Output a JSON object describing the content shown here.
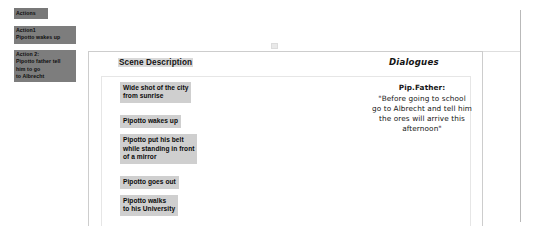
{
  "actions_panel": {
    "title": "Actions",
    "items": [
      {
        "name": "action-1",
        "lines": [
          "Action1",
          "Pipotto wakes up"
        ]
      },
      {
        "name": "action-2",
        "lines": [
          "Action 2:",
          "Pipotto father tell",
          "him to go",
          "to Albrecht"
        ]
      }
    ]
  },
  "columns": {
    "scene_header": "Scene Description",
    "dialogues_header": "Dialogues"
  },
  "scene_cards": [
    {
      "lines": [
        "Wide shot  of the city",
        "from sunrise"
      ]
    },
    {
      "lines": [
        "Pipotto wakes up"
      ]
    },
    {
      "lines": [
        "Pipotto put his belt",
        "while standing in front",
        "of a mirror"
      ]
    },
    {
      "lines": [
        "Pipotto goes out"
      ]
    },
    {
      "lines": [
        "Pipotto walks",
        "to his University"
      ]
    }
  ],
  "dialogue": {
    "speaker": "Pip.Father:",
    "lines": [
      "\"Before going to school",
      "go to Albrecht and tell him",
      "the ores will arrive this",
      "afternoon\""
    ]
  },
  "colors": {
    "note_bg": "#7d7d7d",
    "card_bg": "#cfcfcf",
    "header_highlight": "#d9d9d9",
    "panel_border": "#cdcdcd",
    "rule": "#b9b9b9"
  }
}
